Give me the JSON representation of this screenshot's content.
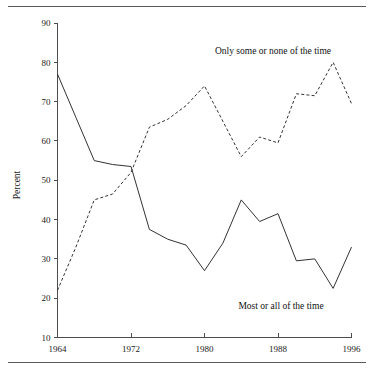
{
  "chart_data": {
    "type": "line",
    "title": "",
    "xlabel": "",
    "ylabel": "Percent",
    "xlim": [
      1964,
      1996
    ],
    "ylim": [
      10,
      90
    ],
    "yticks": [
      10,
      20,
      30,
      40,
      50,
      60,
      70,
      80,
      90
    ],
    "xticks": [
      1964,
      1972,
      1980,
      1988,
      1996
    ],
    "xtick_labels": [
      "1964",
      "1972",
      "1980",
      "1988",
      "1996"
    ],
    "ytick_labels": [
      "10",
      "20",
      "30",
      "40",
      "50",
      "60",
      "70",
      "80",
      "90"
    ],
    "grid": false,
    "legend_position": "inline-annotation",
    "x": [
      1964,
      1966,
      1968,
      1970,
      1972,
      1974,
      1976,
      1978,
      1980,
      1982,
      1984,
      1986,
      1988,
      1990,
      1992,
      1994,
      1996
    ],
    "series": [
      {
        "name": "Most or all of the time",
        "style": "solid",
        "color": "#333333",
        "values": [
          77,
          66,
          55,
          54,
          53.5,
          37.5,
          35,
          33.5,
          27,
          34,
          45,
          39.5,
          41.5,
          29.5,
          30,
          22.5,
          33
        ]
      },
      {
        "name": "Only some or none of the time",
        "style": "dashed",
        "color": "#333333",
        "values": [
          22,
          33,
          45,
          46.5,
          52,
          63.5,
          65.5,
          69,
          74,
          65,
          56,
          61,
          59.5,
          72,
          71.5,
          80,
          69.5
        ]
      }
    ],
    "annotations": [
      {
        "text": "Only some or none of the time",
        "x": 1990,
        "y": 84,
        "anchor": "middle"
      },
      {
        "text": "Most or all of the time",
        "x": 1990,
        "y": 17,
        "anchor": "middle"
      }
    ]
  },
  "figure": {
    "ylabel": "Percent",
    "annotation_upper": "Only some or none of the time",
    "annotation_lower": "Most or all of the time"
  },
  "caption": {
    "text": ""
  },
  "colors": {
    "ink": "#1a1a1a",
    "axis": "#4d4d4d",
    "series": "#333333",
    "rule": "#5a5a5a"
  }
}
